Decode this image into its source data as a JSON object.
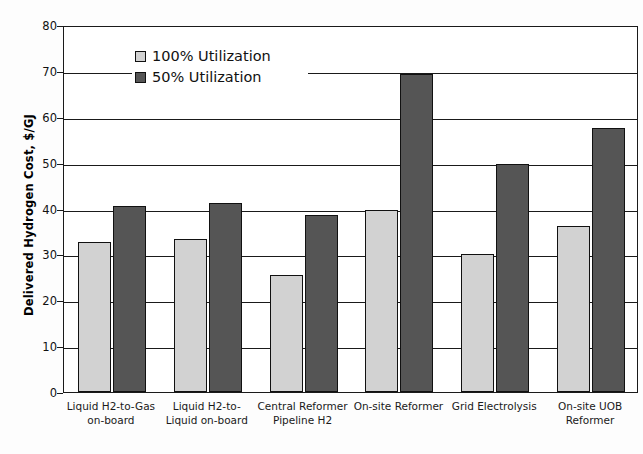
{
  "chart_data": {
    "type": "bar",
    "title": "",
    "xlabel": "",
    "ylabel": "Delivered Hydrogen Cost, $/GJ",
    "ylim": [
      0,
      80
    ],
    "ytick_values": [
      0,
      10,
      20,
      30,
      40,
      50,
      60,
      70,
      80
    ],
    "ytick_labels": [
      "0",
      "10",
      "20",
      "30",
      "40",
      "50",
      "60",
      "70",
      "80"
    ],
    "grid": true,
    "legend_position": "upper-left-inside",
    "categories": [
      "Liquid H2-to-Gas on-board",
      "Liquid H2-to-Liquid on-board",
      "Central Reformer Pipeline H2",
      "On-site Reformer",
      "Grid Electrolysis",
      "On-site UOB Reformer"
    ],
    "category_lines": [
      [
        "Liquid H2-to-Gas",
        "on-board"
      ],
      [
        "Liquid H2-to-",
        "Liquid on-board"
      ],
      [
        "Central Reformer",
        "Pipeline H2"
      ],
      [
        "On-site Reformer",
        ""
      ],
      [
        "Grid Electrolysis",
        ""
      ],
      [
        "On-site UOB",
        "Reformer"
      ]
    ],
    "series": [
      {
        "name": "100% Utilization",
        "color": "#d2d2d2",
        "values": [
          32.8,
          33.4,
          25.6,
          39.7,
          30.0,
          36.2
        ]
      },
      {
        "name": "50% Utilization",
        "color": "#555555",
        "values": [
          40.5,
          41.3,
          38.5,
          69.4,
          49.8,
          57.6
        ]
      }
    ]
  },
  "legend": {
    "items": [
      {
        "label": "100% Utilization"
      },
      {
        "label": "50% Utilization"
      }
    ]
  },
  "axis": {
    "y_title": "Delivered Hydrogen Cost, $/GJ"
  },
  "colors": {
    "series_100": "#d2d2d2",
    "series_50": "#555555",
    "axis": "#1a1a1a",
    "background": "#ffffff"
  }
}
